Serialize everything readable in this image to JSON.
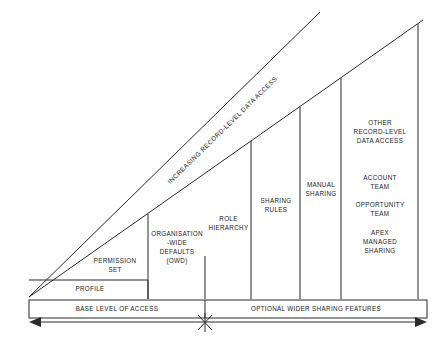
{
  "diagram": {
    "axis_label": "INCREASING RECORD-LEVEL DATA ACCESS",
    "line_color": "#2b2b2b",
    "text_color": "#1d1d1d",
    "background": "#ffffff",
    "columns": [
      {
        "id": "profile",
        "label": "PROFILE"
      },
      {
        "id": "permission-set",
        "label": "PERMISSION\nSET"
      },
      {
        "id": "owd",
        "label": "ORGANISATION\n-WIDE\nDEFAULTS\n(OWD)"
      },
      {
        "id": "role-hierarchy",
        "label": "ROLE\nHIERARCHY"
      },
      {
        "id": "sharing-rules",
        "label": "SHARING\nRULES"
      },
      {
        "id": "manual-sharing",
        "label": "MANUAL\nSHARING"
      },
      {
        "id": "other-access",
        "label": "OTHER\nRECORD-LEVEL\nDATA ACCESS"
      },
      {
        "id": "account-team",
        "label": "ACCOUNT\nTEAM"
      },
      {
        "id": "opportunity-team",
        "label": "OPPORTUNITY\nTEAM"
      },
      {
        "id": "apex-managed-sharing",
        "label": "APEX\nMANAGED\nSHARING"
      }
    ],
    "footer": {
      "left_label": "BASE LEVEL OF ACCESS",
      "right_label": "OPTIONAL WIDER SHARING FEATURES",
      "divider_marker": "x-marker"
    }
  }
}
